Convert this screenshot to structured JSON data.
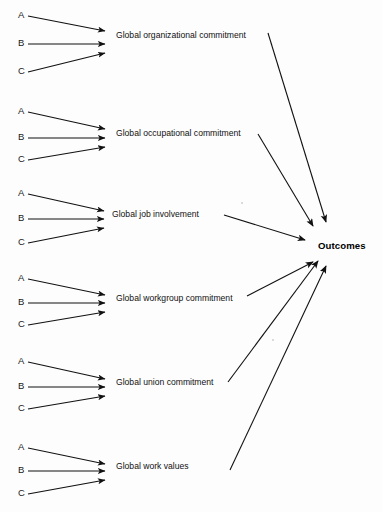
{
  "diagram": {
    "type": "path-model-diagram",
    "title": "",
    "background_color": "#fdfdfd",
    "line_color": "#111111",
    "outcome": {
      "label": "Outcomes",
      "x": 318,
      "y": 246
    },
    "indicator_labels": [
      "A",
      "B",
      "C"
    ],
    "constructs": [
      {
        "id": "global-organizational-commitment",
        "label": "Global organizational commitment",
        "label_x": 116,
        "label_y": 35,
        "arrow_tip_x": 111,
        "indicator_rows": [
          {
            "label": "A",
            "x": 18,
            "y": 16
          },
          {
            "label": "B",
            "x": 18,
            "y": 44
          },
          {
            "label": "C",
            "x": 18,
            "y": 72
          }
        ],
        "outcome_link": {
          "from_x": 268,
          "from_y": 33,
          "to_x": 326,
          "to_y": 224
        }
      },
      {
        "id": "global-occupational-commitment",
        "label": "Global occupational commitment",
        "label_x": 116,
        "label_y": 133,
        "arrow_tip_x": 111,
        "indicator_rows": [
          {
            "label": "A",
            "x": 18,
            "y": 114
          },
          {
            "label": "B",
            "x": 18,
            "y": 133
          },
          {
            "label": "C",
            "x": 18,
            "y": 155
          }
        ],
        "outcome_link": {
          "from_x": 258,
          "from_y": 134,
          "to_x": 313,
          "to_y": 228
        }
      },
      {
        "id": "global-job-involvement",
        "label": "Global job involvement",
        "label_x": 113,
        "label_y": 214,
        "arrow_tip_x": 110,
        "indicator_rows": [
          {
            "label": "A",
            "x": 18,
            "y": 196
          },
          {
            "label": "B",
            "x": 18,
            "y": 214
          },
          {
            "label": "C",
            "x": 18,
            "y": 236
          }
        ],
        "outcome_link": {
          "from_x": 224,
          "from_y": 215,
          "to_x": 307,
          "to_y": 240
        }
      },
      {
        "id": "global-workgroup-commitment",
        "label": "Global workgroup commitment",
        "label_x": 116,
        "label_y": 298,
        "arrow_tip_x": 111,
        "indicator_rows": [
          {
            "label": "A",
            "x": 18,
            "y": 281
          },
          {
            "label": "B",
            "x": 18,
            "y": 298
          },
          {
            "label": "C",
            "x": 18,
            "y": 320
          }
        ],
        "outcome_link": {
          "from_x": 247,
          "from_y": 296,
          "to_x": 312,
          "to_y": 262
        }
      },
      {
        "id": "global-union-commitment",
        "label": "Global union commitment",
        "label_x": 116,
        "label_y": 381,
        "arrow_tip_x": 111,
        "indicator_rows": [
          {
            "label": "A",
            "x": 18,
            "y": 364
          },
          {
            "label": "B",
            "x": 18,
            "y": 381
          },
          {
            "label": "C",
            "x": 18,
            "y": 403
          }
        ],
        "outcome_link": {
          "from_x": 228,
          "from_y": 382,
          "to_x": 318,
          "to_y": 263
        }
      },
      {
        "id": "global-work-values",
        "label": "Global work values",
        "label_x": 116,
        "label_y": 466,
        "arrow_tip_x": 111,
        "indicator_rows": [
          {
            "label": "A",
            "x": 18,
            "y": 450
          },
          {
            "label": "B",
            "x": 18,
            "y": 466
          },
          {
            "label": "C",
            "x": 18,
            "y": 488
          }
        ],
        "outcome_link": {
          "from_x": 230,
          "from_y": 470,
          "to_x": 325,
          "to_y": 268
        }
      }
    ]
  }
}
